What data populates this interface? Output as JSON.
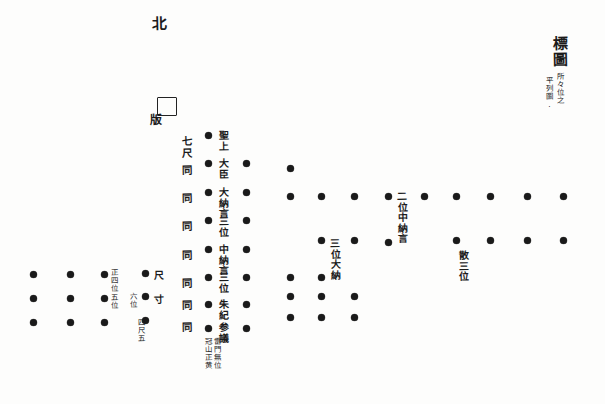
{
  "document": {
    "kind": "hand-drawn seating diagram",
    "title_block": {
      "title": "標圖",
      "annotation_right": "所々位之",
      "annotation_left": "平列圖."
    },
    "orientation_marker": "北",
    "dais": {
      "label": "版",
      "shape": "square"
    }
  },
  "scale_column": {
    "name": "間隔尺度",
    "entries": [
      {
        "text": "七尺"
      },
      {
        "text": "同"
      },
      {
        "text": "同"
      },
      {
        "text": "同"
      },
      {
        "text": "同"
      },
      {
        "text": "同"
      },
      {
        "text": "同"
      },
      {
        "text": "同"
      }
    ]
  },
  "rank_column": {
    "name": "位階列",
    "entries": [
      {
        "text": "聖上"
      },
      {
        "text": "大臣"
      },
      {
        "text": "大納言"
      },
      {
        "text": "三位"
      },
      {
        "text": "中納言"
      },
      {
        "text": "三位"
      },
      {
        "text": "朱紀"
      },
      {
        "text": "参議"
      }
    ]
  },
  "field_labels": [
    {
      "id": "label-nii-chunagon",
      "text": "二位中納言"
    },
    {
      "id": "label-sanmi-dainagon",
      "text": "三位大納"
    },
    {
      "id": "label-san-sanmi",
      "text": "散三位"
    }
  ],
  "footer_note": {
    "right": "雷門無位",
    "left": "冠山正黄"
  },
  "left_cluster": {
    "name": "下位群",
    "labels": [
      {
        "id": "ll-shohachii",
        "text": "正四位"
      },
      {
        "id": "ll-goi",
        "text": "五位"
      },
      {
        "id": "ll-rokui",
        "text": "六位"
      },
      {
        "id": "ll-shaku",
        "text": "尺"
      },
      {
        "id": "ll-sun",
        "text": "寸"
      },
      {
        "id": "ll-shishaku",
        "text": "四尺五"
      }
    ]
  },
  "colors": {
    "ink": "#1a1a1a",
    "paper": "#fdfdfc"
  },
  "dots": {
    "note": "filled circular markers representing seats/positions",
    "main_grid": [
      {
        "x": 208,
        "y": 135
      },
      {
        "x": 208,
        "y": 163
      },
      {
        "x": 208,
        "y": 192
      },
      {
        "x": 208,
        "y": 220
      },
      {
        "x": 208,
        "y": 249
      },
      {
        "x": 208,
        "y": 277
      },
      {
        "x": 208,
        "y": 304
      },
      {
        "x": 208,
        "y": 328
      },
      {
        "x": 246,
        "y": 163
      },
      {
        "x": 246,
        "y": 192
      },
      {
        "x": 246,
        "y": 220
      },
      {
        "x": 246,
        "y": 249
      },
      {
        "x": 246,
        "y": 277
      },
      {
        "x": 246,
        "y": 304
      },
      {
        "x": 246,
        "y": 328
      },
      {
        "x": 290,
        "y": 168
      },
      {
        "x": 290,
        "y": 196
      },
      {
        "x": 290,
        "y": 277
      },
      {
        "x": 290,
        "y": 296
      },
      {
        "x": 290,
        "y": 317
      },
      {
        "x": 321,
        "y": 196
      },
      {
        "x": 321,
        "y": 240
      },
      {
        "x": 321,
        "y": 277
      },
      {
        "x": 321,
        "y": 296
      },
      {
        "x": 321,
        "y": 317
      },
      {
        "x": 354,
        "y": 196
      },
      {
        "x": 354,
        "y": 240
      },
      {
        "x": 354,
        "y": 296
      },
      {
        "x": 354,
        "y": 317
      },
      {
        "x": 388,
        "y": 196
      },
      {
        "x": 388,
        "y": 242
      },
      {
        "x": 424,
        "y": 196
      },
      {
        "x": 456,
        "y": 196
      },
      {
        "x": 456,
        "y": 240
      },
      {
        "x": 490,
        "y": 196
      },
      {
        "x": 490,
        "y": 240
      },
      {
        "x": 527,
        "y": 196
      },
      {
        "x": 527,
        "y": 240
      },
      {
        "x": 563,
        "y": 196
      },
      {
        "x": 563,
        "y": 240
      }
    ],
    "left_cluster": [
      {
        "x": 33,
        "y": 274
      },
      {
        "x": 33,
        "y": 298
      },
      {
        "x": 33,
        "y": 322
      },
      {
        "x": 70,
        "y": 274
      },
      {
        "x": 70,
        "y": 298
      },
      {
        "x": 70,
        "y": 322
      },
      {
        "x": 104,
        "y": 274
      },
      {
        "x": 104,
        "y": 298
      },
      {
        "x": 104,
        "y": 322
      },
      {
        "x": 145,
        "y": 273
      },
      {
        "x": 145,
        "y": 296
      },
      {
        "x": 145,
        "y": 320
      }
    ]
  }
}
